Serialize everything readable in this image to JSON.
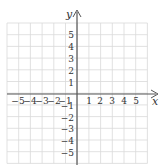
{
  "diagram": {
    "type": "coordinate-plane",
    "axes": {
      "x_label": "x",
      "y_label": "y"
    },
    "x_ticks": [
      "−5",
      "−4",
      "−3",
      "−2",
      "−1",
      "1",
      "2",
      "3",
      "4",
      "5"
    ],
    "y_ticks_positive": [
      "5",
      "4",
      "3",
      "2",
      "1"
    ],
    "y_ticks_negative": [
      "−1",
      "−2",
      "−3",
      "−4",
      "−5"
    ],
    "x_range": [
      -6,
      6
    ],
    "y_range": [
      -6,
      6
    ],
    "colors": {
      "grid": "#d9d9d9",
      "axis": "#555555",
      "text": "#333333"
    }
  }
}
